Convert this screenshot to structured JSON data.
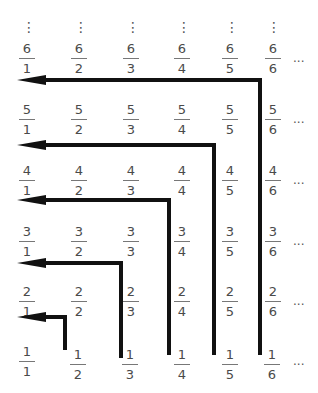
{
  "diagram": {
    "vertical_ellipsis": "⋮",
    "horizontal_ellipsis": "···",
    "rows": [
      {
        "numerator": "6",
        "denominators": [
          "1",
          "2",
          "3",
          "4",
          "5",
          "6"
        ]
      },
      {
        "numerator": "5",
        "denominators": [
          "1",
          "2",
          "3",
          "4",
          "5",
          "6"
        ]
      },
      {
        "numerator": "4",
        "denominators": [
          "1",
          "2",
          "3",
          "4",
          "5",
          "6"
        ]
      },
      {
        "numerator": "3",
        "denominators": [
          "1",
          "2",
          "3",
          "4",
          "5",
          "6"
        ]
      },
      {
        "numerator": "2",
        "denominators": [
          "1",
          "2",
          "3",
          "4",
          "5",
          "6"
        ]
      },
      {
        "numerator": "1",
        "denominators": [
          "1",
          "2",
          "3",
          "4",
          "5",
          "6"
        ]
      }
    ],
    "arrows": [
      {
        "id": "arrow-1",
        "from_column": 2,
        "to_row": 1,
        "direction": "up-then-left"
      },
      {
        "id": "arrow-2",
        "from_column": 3,
        "to_row": 2,
        "direction": "up-then-left"
      },
      {
        "id": "arrow-3",
        "from_column": 4,
        "to_row": 3,
        "direction": "up-then-left"
      },
      {
        "id": "arrow-4",
        "from_column": 5,
        "to_row": 4,
        "direction": "up-then-left"
      },
      {
        "id": "arrow-5",
        "from_column": 6,
        "to_row": 5,
        "direction": "up-then-left"
      }
    ],
    "colors": {
      "text": "#4a4a4a",
      "arrow": "#111111",
      "background": "#ffffff"
    }
  }
}
